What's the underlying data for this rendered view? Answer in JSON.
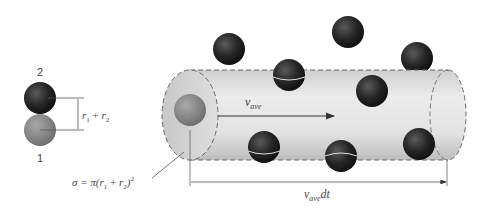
{
  "diagram": {
    "type": "collision-cylinder",
    "left_inset": {
      "molecule_top_label": "2",
      "molecule_bottom_label": "1",
      "separation_label": {
        "r1": "r",
        "sub1": "1",
        "plus": " + ",
        "r2": "r",
        "sub2": "2"
      }
    },
    "cylinder": {
      "velocity_label": {
        "v": "v",
        "sub": "ave"
      },
      "length_label": {
        "v": "v",
        "sub": "ave",
        "suffix": "dt"
      },
      "cross_section_label": {
        "prefix": "σ = π(",
        "r1": "r",
        "sub1": "1",
        "plus": " + ",
        "r2": "r",
        "sub2": "2",
        "suffix": ")",
        "exp": "2"
      }
    },
    "colors": {
      "cylinder_fill": "#dcdcdc",
      "molecule_dark": "#262626",
      "molecule_gray": "#8a8a8a",
      "line": "#555555"
    }
  }
}
